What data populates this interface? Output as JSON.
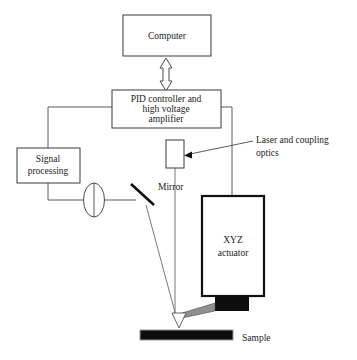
{
  "figure": {
    "kind": "afm-schematic"
  },
  "blocks": {
    "computer": {
      "label": "Computer"
    },
    "controller": {
      "line1": "PID controller and",
      "line2": "high voltage",
      "line3": "amplifier"
    },
    "signal_processing": {
      "line1": "Signal",
      "line2": "processing"
    },
    "actuator": {
      "line1": "XYZ",
      "line2": "actuator"
    },
    "laser": {
      "label": ""
    }
  },
  "labels": {
    "mirror": "Mirror",
    "sample": "Sample",
    "laser_optics_line1": "Laser and coupling",
    "laser_optics_line2": "optics"
  },
  "colors": {
    "background": "#ffffff",
    "box_stroke": "#3a3a3a",
    "thick_stroke": "#111111",
    "wire": "#5a5a5a",
    "beam": "#6a6a6a",
    "text": "#1a1a1a",
    "black_fill": "#0d0d0d",
    "cantilever_gray": "#8f8f8f"
  }
}
